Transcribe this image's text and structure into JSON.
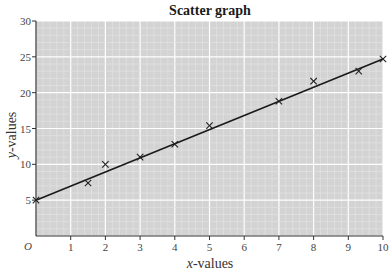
{
  "chart_data": {
    "type": "scatter",
    "title": "Scatter graph",
    "xlabel": "x-values",
    "ylabel": "y-values",
    "xlabel_var": "x",
    "xlabel_rest": "-values",
    "ylabel_var": "y",
    "ylabel_rest": "-values",
    "origin_label": "O",
    "xlim": [
      0,
      10
    ],
    "ylim": [
      0,
      30
    ],
    "xticks": [
      1,
      2,
      3,
      4,
      5,
      6,
      7,
      8,
      9,
      10
    ],
    "yticks": [
      5,
      10,
      15,
      20,
      25,
      30
    ],
    "grid": true,
    "legend": null,
    "marker": "x",
    "points": [
      {
        "x": 0,
        "y": 5
      },
      {
        "x": 1.5,
        "y": 7.4
      },
      {
        "x": 2,
        "y": 10
      },
      {
        "x": 3,
        "y": 11
      },
      {
        "x": 4,
        "y": 12.8
      },
      {
        "x": 5,
        "y": 15.4
      },
      {
        "x": 7,
        "y": 18.8
      },
      {
        "x": 8,
        "y": 21.6
      },
      {
        "x": 9.3,
        "y": 23
      },
      {
        "x": 10,
        "y": 24.7
      }
    ],
    "line_of_best_fit": {
      "x1": 0,
      "y1": 5,
      "x2": 10,
      "y2": 24.7
    }
  },
  "colors": {
    "plot_bg": "#d3d3d3",
    "grid_minor": "#e6e6e6",
    "grid_major": "#ffffff",
    "axis": "#333333",
    "marker": "#222222",
    "line": "#1a1a1a"
  }
}
